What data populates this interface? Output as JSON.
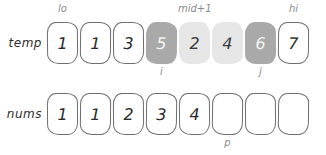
{
  "diagram": {
    "rows": [
      {
        "label": "temp",
        "cells": [
          {
            "value": "1",
            "state": "white"
          },
          {
            "value": "1",
            "state": "white"
          },
          {
            "value": "3",
            "state": "white"
          },
          {
            "value": "5",
            "state": "dark"
          },
          {
            "value": "2",
            "state": "light"
          },
          {
            "value": "4",
            "state": "light"
          },
          {
            "value": "6",
            "state": "dark"
          },
          {
            "value": "7",
            "state": "white"
          }
        ],
        "pointers_above": [
          {
            "label": "lo",
            "index": 0
          },
          {
            "label": "mid+1",
            "index": 4
          },
          {
            "label": "hi",
            "index": 7
          }
        ],
        "pointers_below": [
          {
            "label": "i",
            "index": 3
          },
          {
            "label": "j",
            "index": 6
          }
        ]
      },
      {
        "label": "nums",
        "cells": [
          {
            "value": "1",
            "state": "white"
          },
          {
            "value": "1",
            "state": "white"
          },
          {
            "value": "2",
            "state": "white"
          },
          {
            "value": "3",
            "state": "white"
          },
          {
            "value": "4",
            "state": "white"
          },
          {
            "value": "",
            "state": "white"
          },
          {
            "value": "",
            "state": "white"
          },
          {
            "value": "",
            "state": "white"
          }
        ],
        "pointers_above": [],
        "pointers_below": [
          {
            "label": "p",
            "index": 5
          }
        ]
      }
    ],
    "colors": {
      "cell_dark": "#a9a9a9",
      "cell_light": "#e6e6e6",
      "cell_outline": "#6e6e6e",
      "pointer_label": "#8a8a8a",
      "row_label": "#2e2e2e"
    }
  }
}
